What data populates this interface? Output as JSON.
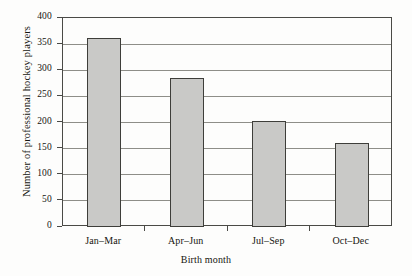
{
  "chart_data": {
    "type": "bar",
    "title": "",
    "xlabel": "Birth month",
    "ylabel": "Number of professional hockey players",
    "categories": [
      "Jan–Mar",
      "Apr–Jun",
      "Jul–Sep",
      "Oct–Dec"
    ],
    "values": [
      362,
      285,
      203,
      160
    ],
    "series": [
      {
        "name": "Number of professional hockey players",
        "values": [
          362,
          285,
          203,
          160
        ]
      }
    ],
    "ylim": [
      0,
      400
    ],
    "yticks": [
      0,
      50,
      100,
      150,
      200,
      250,
      300,
      350,
      400
    ],
    "ytick_labels": [
      "0",
      "50",
      "100",
      "150",
      "200",
      "250",
      "300",
      "350",
      "400"
    ],
    "grid": "horizontal",
    "legend": "none",
    "bar_fill_color": "#c9c9c7",
    "bar_edge_color": "#3e3e3a",
    "gridline_color": "#8e8e88",
    "frame_color": "#4a4a46",
    "background_color": "#fdfdfc"
  }
}
